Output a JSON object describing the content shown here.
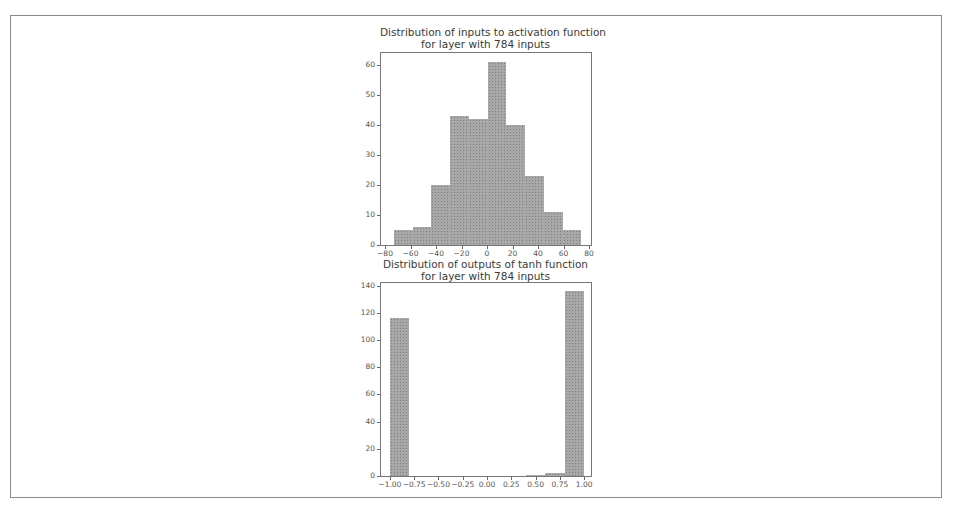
{
  "chart_data": [
    {
      "type": "bar",
      "title": "Distribution of inputs to activation function\nfor layer with 784 inputs",
      "xlabel": "",
      "ylabel": "",
      "xlim": [
        -80,
        80
      ],
      "ylim": [
        0,
        64
      ],
      "xticks": [
        -80,
        -60,
        -40,
        -20,
        0,
        20,
        40,
        60,
        80
      ],
      "xtick_labels": [
        "−80",
        "−60",
        "−40",
        "−20",
        "0",
        "20",
        "40",
        "60",
        "80"
      ],
      "yticks": [
        0,
        10,
        20,
        30,
        40,
        50,
        60
      ],
      "ytick_labels": [
        "0",
        "10",
        "20",
        "30",
        "40",
        "50",
        "60"
      ],
      "bin_edges": [
        -73,
        -58.3,
        -43.6,
        -28.9,
        -14.2,
        0.5,
        15.2,
        29.9,
        44.6,
        59.3,
        74
      ],
      "values": [
        5,
        6,
        20,
        43,
        42,
        61,
        40,
        23,
        11,
        5
      ],
      "grid": false,
      "legend": null
    },
    {
      "type": "bar",
      "title": "Distribution of outputs of tanh function\nfor layer with 784 inputs",
      "xlabel": "",
      "ylabel": "",
      "xlim": [
        -1.05,
        1.05
      ],
      "ylim": [
        0,
        142
      ],
      "xticks": [
        -1.0,
        -0.75,
        -0.5,
        -0.25,
        0.0,
        0.25,
        0.5,
        0.75,
        1.0
      ],
      "xtick_labels": [
        "−1.00",
        "−0.75",
        "−0.50",
        "−0.25",
        "0.00",
        "0.25",
        "0.50",
        "0.75",
        "1.00"
      ],
      "yticks": [
        0,
        20,
        40,
        60,
        80,
        100,
        120,
        140
      ],
      "ytick_labels": [
        "0",
        "20",
        "40",
        "60",
        "80",
        "100",
        "120",
        "140"
      ],
      "bin_edges": [
        -1.0,
        -0.8,
        -0.6,
        -0.4,
        -0.2,
        0.0,
        0.2,
        0.4,
        0.6,
        0.8,
        1.0
      ],
      "values": [
        116,
        0,
        0,
        0,
        0,
        0,
        0,
        1,
        2,
        136
      ],
      "grid": false,
      "legend": null
    }
  ]
}
